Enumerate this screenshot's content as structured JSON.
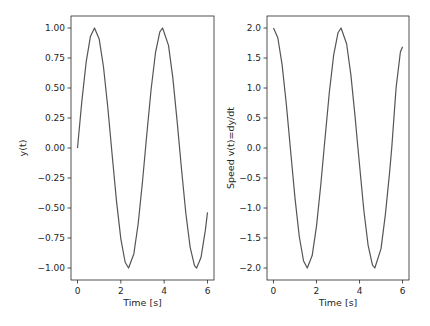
{
  "chart_data": [
    {
      "type": "line",
      "title": "",
      "xlabel": "Time [s]",
      "ylabel": "y(t)",
      "xlim": [
        -0.3,
        6.3
      ],
      "ylim": [
        -1.1,
        1.1
      ],
      "xticks": [
        0,
        2,
        4,
        6
      ],
      "xtick_labels": [
        "0",
        "2",
        "4",
        "6"
      ],
      "yticks": [
        1.0,
        0.75,
        0.5,
        0.25,
        0.0,
        -0.25,
        -0.5,
        -0.75,
        -1.0
      ],
      "ytick_labels": [
        "1.00",
        "0.75",
        "0.50",
        "0.25",
        "0.00",
        "−0.25",
        "−0.50",
        "−0.75",
        "−1.00"
      ],
      "grid": false,
      "line_color": "#555555",
      "series": [
        {
          "name": "y(t)",
          "x": [
            0.0,
            0.2,
            0.4,
            0.6,
            0.785,
            1.0,
            1.2,
            1.4,
            1.6,
            1.8,
            2.0,
            2.2,
            2.356,
            2.6,
            2.8,
            3.0,
            3.2,
            3.4,
            3.6,
            3.8,
            3.927,
            4.2,
            4.4,
            4.6,
            4.8,
            5.0,
            5.2,
            5.4,
            5.498,
            5.7,
            5.9,
            6.0
          ],
          "y": [
            0.0,
            0.389,
            0.717,
            0.932,
            1.0,
            0.909,
            0.675,
            0.335,
            -0.058,
            -0.443,
            -0.757,
            -0.952,
            -1.0,
            -0.883,
            -0.631,
            -0.279,
            0.117,
            0.494,
            0.794,
            0.968,
            1.0,
            0.855,
            0.584,
            0.22,
            -0.175,
            -0.544,
            -0.828,
            -0.98,
            -1.0,
            -0.913,
            -0.687,
            -0.537
          ]
        }
      ]
    },
    {
      "type": "line",
      "title": "",
      "xlabel": "Time [s]",
      "ylabel": "Speed v(t)=dy/dt",
      "xlim": [
        -0.3,
        6.3
      ],
      "ylim": [
        -2.2,
        2.2
      ],
      "xticks": [
        0,
        2,
        4,
        6
      ],
      "xtick_labels": [
        "0",
        "2",
        "4",
        "6"
      ],
      "yticks": [
        2.0,
        1.5,
        1.0,
        0.5,
        0.0,
        -0.5,
        -1.0,
        -1.5,
        -2.0
      ],
      "ytick_labels": [
        "2.0",
        "1.5",
        "1.0",
        "0.5",
        "0.0",
        "−0.5",
        "−1.0",
        "−1.5",
        "−2.0"
      ],
      "grid": false,
      "line_color": "#555555",
      "series": [
        {
          "name": "v(t)",
          "x": [
            0.0,
            0.2,
            0.4,
            0.6,
            0.785,
            1.0,
            1.2,
            1.4,
            1.571,
            1.8,
            2.0,
            2.2,
            2.356,
            2.6,
            2.8,
            3.0,
            3.142,
            3.4,
            3.6,
            3.8,
            3.927,
            4.2,
            4.4,
            4.6,
            4.712,
            5.0,
            5.2,
            5.4,
            5.498,
            5.7,
            5.9,
            6.0
          ],
          "y": [
            2.0,
            1.842,
            1.393,
            0.725,
            0.0,
            -0.832,
            -1.475,
            -1.884,
            -2.0,
            -1.793,
            -1.307,
            -0.612,
            0.0,
            0.937,
            1.551,
            1.92,
            2.0,
            1.738,
            1.214,
            0.497,
            0.0,
            -1.038,
            -1.621,
            -1.949,
            -2.0,
            -1.678,
            -1.114,
            -0.397,
            0.0,
            1.002,
            1.6,
            1.688
          ]
        }
      ]
    }
  ]
}
